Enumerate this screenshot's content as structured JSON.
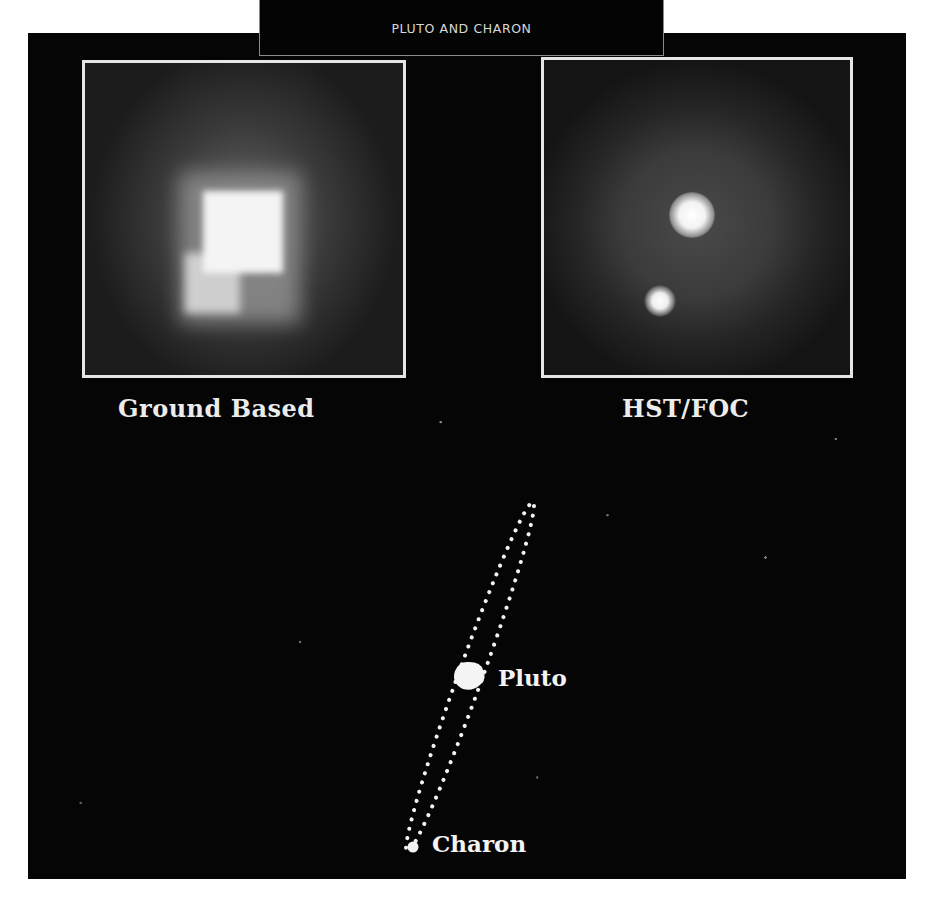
{
  "title": "PLUTO AND CHARON",
  "panels": [
    {
      "id": "ground",
      "caption": "Ground Based"
    },
    {
      "id": "hst",
      "caption": "HST/FOC"
    }
  ],
  "diagram": {
    "labels": {
      "pluto": "Pluto",
      "charon": "Charon"
    }
  },
  "colors": {
    "background": "#ffffff",
    "panel": "#050505",
    "frame": "#e6e6e6",
    "text": "#ececec"
  }
}
